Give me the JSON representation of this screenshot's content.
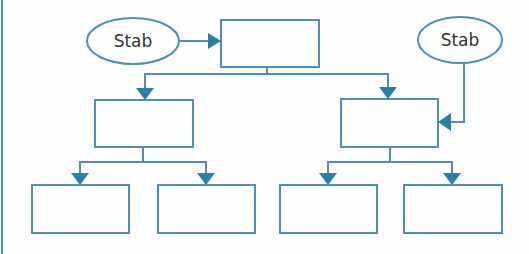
{
  "diagram": {
    "type": "hierarchy-flowchart",
    "colors": {
      "box_stroke": "#4f8fb5",
      "line_stroke": "#4f8fb5",
      "arrowhead_fill": "#2a7fa6",
      "frame_line": "#5b8fb5",
      "text": "#333333",
      "background": "#fefefe"
    },
    "ellipses": [
      {
        "id": "stab-left",
        "label": "Stab",
        "cx": 133,
        "cy": 41,
        "rx": 46,
        "ry": 23
      },
      {
        "id": "stab-right",
        "label": "Stab",
        "cx": 460,
        "cy": 40,
        "rx": 42,
        "ry": 23
      }
    ],
    "boxes": [
      {
        "id": "top",
        "label": "",
        "x": 221,
        "y": 20,
        "w": 98,
        "h": 47
      },
      {
        "id": "mid-left",
        "label": "",
        "x": 95,
        "y": 100,
        "w": 98,
        "h": 47
      },
      {
        "id": "mid-right",
        "label": "",
        "x": 341,
        "y": 99,
        "w": 97,
        "h": 48
      },
      {
        "id": "bottom-1",
        "label": "",
        "x": 32,
        "y": 185,
        "w": 97,
        "h": 48
      },
      {
        "id": "bottom-2",
        "label": "",
        "x": 158,
        "y": 185,
        "w": 97,
        "h": 48
      },
      {
        "id": "bottom-3",
        "label": "",
        "x": 280,
        "y": 185,
        "w": 97,
        "h": 48
      },
      {
        "id": "bottom-4",
        "label": "",
        "x": 404,
        "y": 185,
        "w": 98,
        "h": 48
      }
    ],
    "connections": [
      {
        "from": "stab-left",
        "to": "top",
        "direction": "right"
      },
      {
        "from": "top",
        "to": "mid-left",
        "direction": "down"
      },
      {
        "from": "top",
        "to": "mid-right",
        "direction": "down"
      },
      {
        "from": "stab-right",
        "to": "mid-right",
        "direction": "left"
      },
      {
        "from": "mid-left",
        "to": "bottom-1",
        "direction": "down"
      },
      {
        "from": "mid-left",
        "to": "bottom-2",
        "direction": "down"
      },
      {
        "from": "mid-right",
        "to": "bottom-3",
        "direction": "down"
      },
      {
        "from": "mid-right",
        "to": "bottom-4",
        "direction": "down"
      }
    ]
  }
}
